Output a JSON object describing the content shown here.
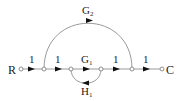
{
  "diagram": {
    "type": "signal-flow-graph",
    "colors": {
      "line": "#9a9a9a",
      "arrow": "#111111",
      "text": "#222222",
      "node_fill": "#ffffff"
    },
    "input_label": "R",
    "output_label": "C",
    "nodes": [
      {
        "id": "n1",
        "x": 21
      },
      {
        "id": "n2",
        "x": 44
      },
      {
        "id": "n3",
        "x": 71
      },
      {
        "id": "n4",
        "x": 101
      },
      {
        "id": "n5",
        "x": 132
      },
      {
        "id": "n6",
        "x": 162
      }
    ],
    "branches": [
      {
        "from": "n1",
        "to": "n2",
        "gain": "1"
      },
      {
        "from": "n2",
        "to": "n3",
        "gain": "1"
      },
      {
        "from": "n3",
        "to": "n4",
        "gain": "G1",
        "gain_main": "G",
        "gain_sub": "1"
      },
      {
        "from": "n4",
        "to": "n5",
        "gain": "1"
      },
      {
        "from": "n5",
        "to": "n6",
        "gain": "1"
      }
    ],
    "feedforward": {
      "from": "n2",
      "to": "n5",
      "gain": "G2",
      "gain_main": "G",
      "gain_sub": "2"
    },
    "feedback": {
      "from": "n4",
      "to": "n3",
      "gain": "H1",
      "gain_main": "H",
      "gain_sub": "1"
    }
  }
}
